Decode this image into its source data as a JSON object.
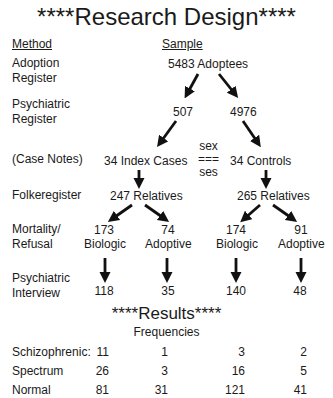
{
  "title": "****Research Design****",
  "headers": {
    "method": "Method",
    "sample": "Sample"
  },
  "methods": [
    "Adoption\nRegister",
    "Psychiatric\nRegister",
    "(Case Notes)",
    "Folkeregister",
    "Mortality/\nRefusal",
    "Psychiatric\nInterview"
  ],
  "method_lines": {
    "adoption_1": "Adoption",
    "adoption_2": "Register",
    "psych_1": "Psychiatric",
    "psych_2": "Register",
    "case_notes": "(Case Notes)",
    "folke": "Folkeregister",
    "mort_1": "Mortality/",
    "mort_2": "Refusal",
    "interview_1": "Psychiatric",
    "interview_2": "Interview"
  },
  "nodes": {
    "adoptees": "5483 Adoptees",
    "n507": "507",
    "n4976": "4976",
    "index_cases": "34 Index Cases",
    "controls": "34 Controls",
    "match_1": "sex",
    "match_2": "===",
    "match_3": "ses",
    "rel_index": "247 Relatives",
    "rel_control": "265 Relatives",
    "bio_index_n": "173",
    "bio_index_l": "Biologic",
    "adp_index_n": "74",
    "adp_index_l": "Adoptive",
    "bio_control_n": "174",
    "bio_control_l": "Biologic",
    "adp_control_n": "91",
    "adp_control_l": "Adoptive",
    "int_bio_index": "118",
    "int_adp_index": "35",
    "int_bio_control": "140",
    "int_adp_control": "48"
  },
  "results": {
    "title": "****Results****",
    "subtitle": "Frequencies",
    "rows": [
      {
        "label": "Schizophrenic:",
        "values": [
          "11",
          "1",
          "3",
          "2"
        ]
      },
      {
        "label": "Spectrum",
        "values": [
          "26",
          "3",
          "16",
          "5"
        ]
      },
      {
        "label": "Normal",
        "values": [
          "81",
          "31",
          "121",
          "41"
        ]
      }
    ]
  },
  "icons": {
    "arrow": "down-arrow-icon",
    "diag_arrow": "diagonal-arrow-icon"
  }
}
